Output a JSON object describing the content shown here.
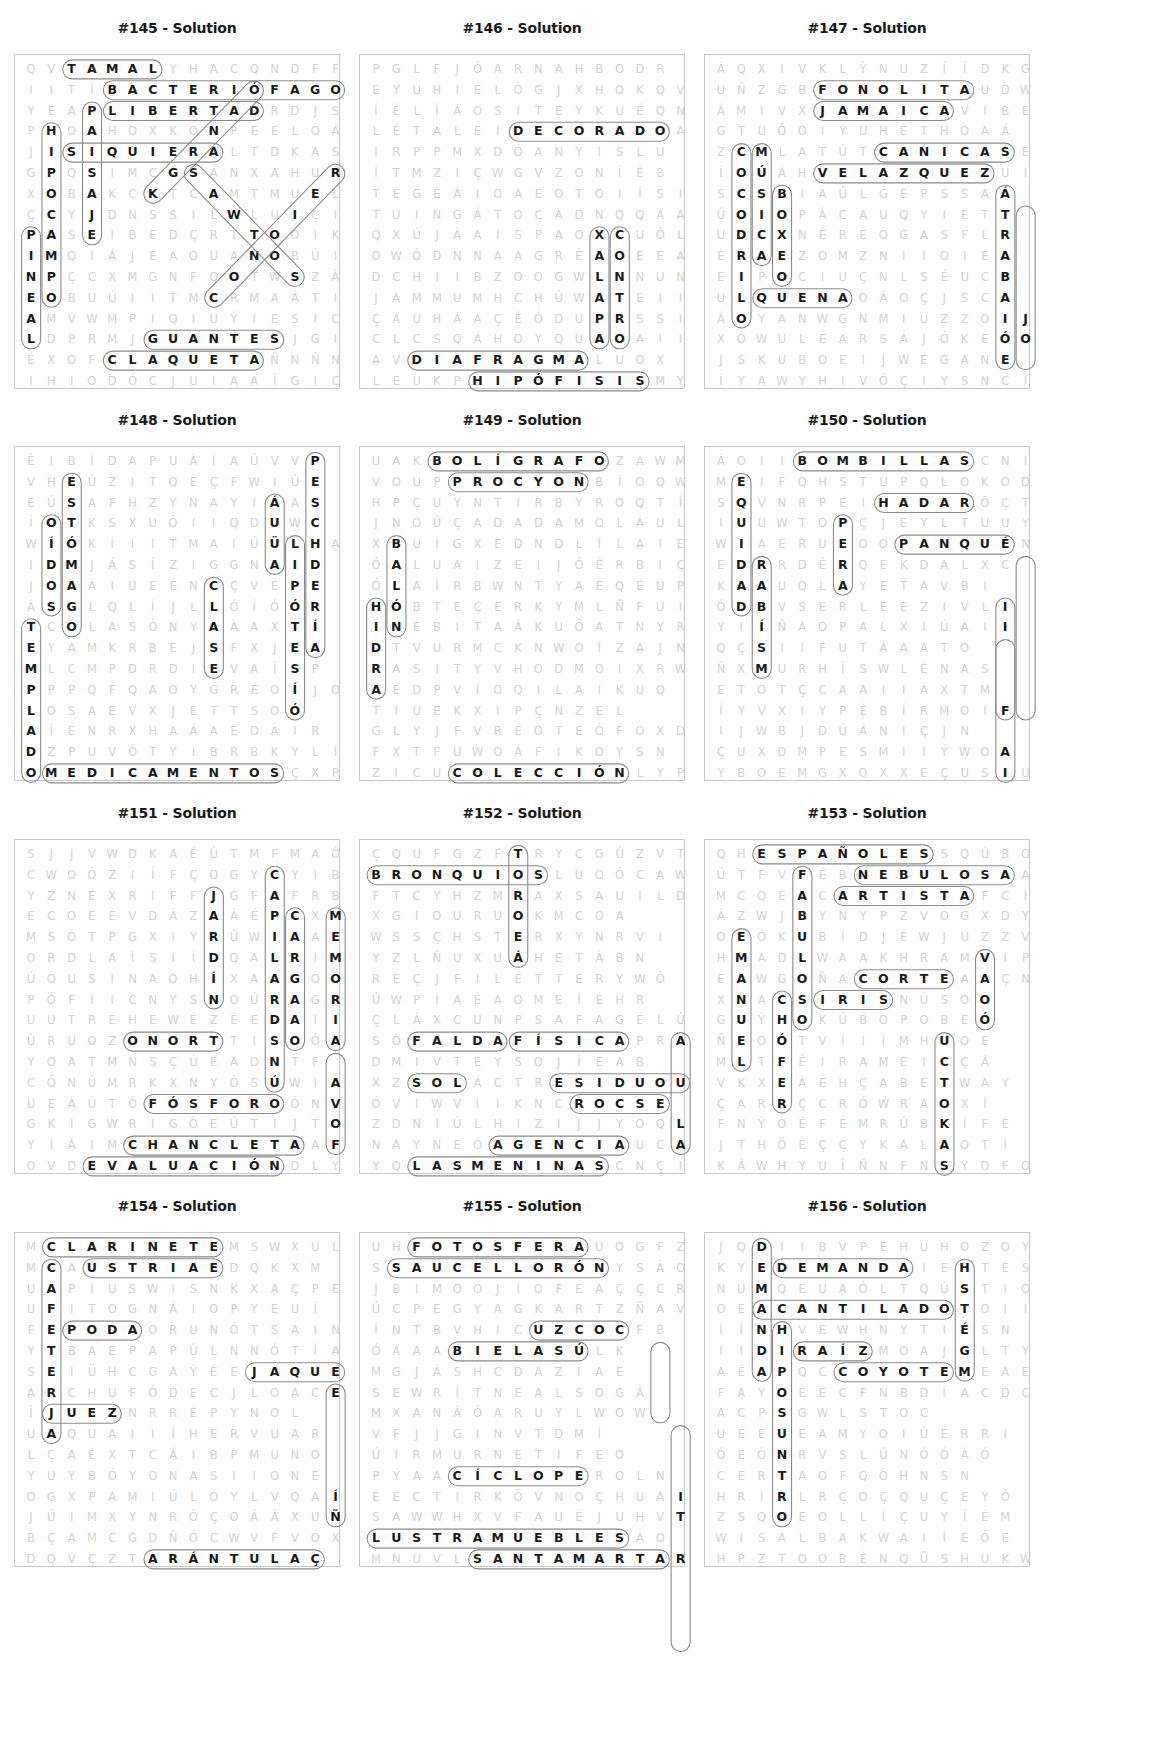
{
  "layout": {
    "cols": 16,
    "rows": 16
  },
  "puzzles": [
    {
      "title": "#145 - Solution",
      "grid": [
        "QVTAMALYHACQNDFF",
        "IITÍBACTERIÓFAGO",
        "YEAPLIBERTADRDJS",
        "PHOAHOXKONPEELOÁ",
        "JISIQUIERALTDKAS",
        "GPQSIMÇGSANXAHUR",
        "XOBAKCKTCAMTMUEL",
        "ÇCYJDNSSILWLUICI",
        "PASEIBEDÇRTTOOIK",
        "IMQIÁJEAOUANOBÚI",
        "NPÇCXMGNFQOTWSZÁ",
        "EOBUÚIITMCRMAÁTI",
        "AMVWMPIQIUÝIESIC",
        "LDPRMJGUANTESJGI",
        "ÉXOFCLAQUETAÑNÑN",
        "IHIODÓCJUIAAÍGIÇ"
      ],
      "words": [
        {
          "w": "TAMAL",
          "r": 0,
          "c": 2,
          "d": "E"
        },
        {
          "w": "BACTERIÓFAGO",
          "r": 1,
          "c": 4,
          "d": "E"
        },
        {
          "w": "LIBERTAD",
          "r": 2,
          "c": 4,
          "d": "E"
        },
        {
          "w": "PAISAJE",
          "r": 2,
          "c": 3,
          "d": "S"
        },
        {
          "w": "HIPOCAMPO",
          "r": 3,
          "c": 1,
          "d": "S"
        },
        {
          "w": "SIQUIERA",
          "r": 4,
          "c": 2,
          "d": "E"
        },
        {
          "w": "PINEAL",
          "r": 8,
          "c": 0,
          "d": "S"
        },
        {
          "w": "GUANTES",
          "r": 13,
          "c": 6,
          "d": "E"
        },
        {
          "w": "CLAQUETA",
          "r": 14,
          "c": 4,
          "d": "E"
        },
        {
          "w": "SANTOS",
          "r": 5,
          "c": 8,
          "d": "SE"
        },
        {
          "w": "RECETAS",
          "r": 5,
          "c": 15,
          "d": "SW"
        },
        {
          "w": "ÓRGANO",
          "r": 1,
          "c": 11,
          "d": "SW"
        }
      ]
    },
    {
      "title": "#146 - Solution",
      "grid": [
        "PGLFJÓARNAHBODR",
        "EYUHIÉLÓGJXHOKQV",
        "ÍÉLÍAOSITEYKUÉQN",
        "LÉTÁLEIDECORADOA",
        "IRPPMXDÓANYISLU",
        "ÍTMZIÇWGVZONÍÉB",
        "TEGÉÁIOAEOTOIÍSI",
        "TUINGÁTOCADNQQAA",
        "QXÚJÀAISPAOXCUÕL",
        "OWÓDNNAAGRÉAOEEA",
        "DCHIIBZOOGWLNNUN",
        "JAMMUMHCHÚWATEII",
        "ÇAUHAAÇÉÓDUPRSSI",
        "CLCSQÁHOYQUAOAII",
        "AVDIAFRAGMALUOX",
        "LEUKPHIPÓFISISMY"
      ],
      "words": [
        {
          "w": "DECORADO",
          "r": 3,
          "c": 7,
          "d": "E"
        },
        {
          "w": "DIAFRAGMA",
          "r": 14,
          "c": 2,
          "d": "E"
        },
        {
          "w": "HIPÓFISIS",
          "r": 15,
          "c": 5,
          "d": "E"
        },
        {
          "w": "XALAPA",
          "r": 8,
          "c": 11,
          "d": "S"
        },
        {
          "w": "CONTRO",
          "r": 8,
          "c": 12,
          "d": "S"
        }
      ]
    },
    {
      "title": "#147 - Solution",
      "grid": [
        "ÁQXIVKLÝNUZÍÍDKG",
        "UÑZGBFONOLITAUDW",
        "ÁMIVXJAMAICAVIBE",
        "GTUÕOIÝUHÉTHOAÁ",
        "ZCMLATÚTCANICASE",
        "ÍOÚÁHVELAZQUEZUI",
        "SCSBIAÚLGEPSSAÁ",
        "ÚOIOPÁCAUQYIETT",
        "UDCXNÉRÉOGASFLR",
        "ÉRAEZOMZNIIOIEA",
        "EIPOCIUÇNLSÉUCB",
        "ULQUENAOÁOÇJSCA",
        "ÁOYANWGNMIUZZOIJ",
        "XÓWULEARSÁJÓKEÓO",
        "JSKUBOEIJWÉGANE",
        "ÍYAWYHIVÓÇIYSNCI"
      ],
      "words": [
        {
          "w": "FONOLITA",
          "r": 1,
          "c": 5,
          "d": "E"
        },
        {
          "w": "JAMAICA",
          "r": 2,
          "c": 5,
          "d": "E"
        },
        {
          "w": "CANICAS",
          "r": 4,
          "c": 8,
          "d": "E"
        },
        {
          "w": "VELAZQUEZ",
          "r": 5,
          "c": 5,
          "d": "E"
        },
        {
          "w": "COCODRILO",
          "r": 4,
          "c": 1,
          "d": "S"
        },
        {
          "w": "MÚSICA",
          "r": 4,
          "c": 2,
          "d": "S"
        },
        {
          "w": "BOXEO",
          "r": 6,
          "c": 3,
          "d": "S"
        },
        {
          "w": "QUENA",
          "r": 11,
          "c": 2,
          "d": "E"
        },
        {
          "w": "ELECTRICA",
          "r": 6,
          "c": 14,
          "d": "S"
        },
        {
          "w": "TREBEJOS",
          "r": 7,
          "c": 15,
          "d": "S"
        }
      ]
    },
    {
      "title": "#148 - Solution",
      "grid": [
        "ÉIBÍDAPUÁÍAÚVVP",
        "VHEÚZITQÉÇFWIÚE",
        "EÚSAFHZYNAYIÁAS",
        "ÍOTKSXUÓIIQDUWC",
        "WÍÓKÍIITMAIÚÜLHA",
        "IDMJÁSÍZIGGNAID",
        "JOAÁIUEÉNCÇVÉPE",
        "ÁSGLQLÍJLLÓÍÓÓR",
        "TCOLASÓNYAÀAXTÍ",
        "EYAMKRBEJSFXJEA",
        "MLCMPDRDIEVAÍSP",
        "PPPQFQAOYGRÉOÍJO",
        "LOSAEVXJETTSOÓ",
        "AÍENRXHAÁAÉOÁIR",
        "DZPUVÓTYIBRBKYLÍ",
        "OMEDICAMENTOSÇXP"
      ],
      "words": [
        {
          "w": "ESTÓMAGO",
          "r": 1,
          "c": 2,
          "d": "S"
        },
        {
          "w": "OÍDOS",
          "r": 3,
          "c": 1,
          "d": "S"
        },
        {
          "w": "AULA",
          "r": 2,
          "c": 12,
          "d": "S"
        },
        {
          "w": "HIPÓTESIS",
          "r": 4,
          "c": 13,
          "d": "S"
        },
        {
          "w": "PESCADERÍA",
          "r": 0,
          "c": 14,
          "d": "S"
        },
        {
          "w": "CLASE",
          "r": 6,
          "c": 9,
          "d": "S"
        },
        {
          "w": "TEMPLADO",
          "r": 8,
          "c": 0,
          "d": "S"
        },
        {
          "w": "MEDICAMENTOS",
          "r": 15,
          "c": 1,
          "d": "E"
        }
      ]
    },
    {
      "title": "#149 - Solution",
      "grid": [
        "UAKBOLÍGRAFOZAWM",
        "VOUPPROCYONBÍOQW",
        "HPÇUYNTIRBYROQTÍ",
        "JNOÚÇADADAMOLÁULI",
        "XBUÍGXEDNDLÍLAIE",
        "ÓALUAIZEIJÓÉRBIÇ",
        "ÓLAÍRBWNTYAEQÉUP",
        "HÓBTEÇERKYMLÑFUI",
        "INEBITAÁKUÕATNYR",
        "DTVURMCKNWOÍZAJN",
        "RASITYVHODMOIXRW",
        "AÉDPVÍOQILAIKUQ",
        "TIUEKXIPÇNZEL",
        "GLYJFVREOTEÓFOXD",
        "FXTFUWOÁFIKOYSN",
        "ZICUCOLECCIÓNLYP"
      ],
      "words": [
        {
          "w": "BOLÍGRAFO",
          "r": 0,
          "c": 3,
          "d": "E"
        },
        {
          "w": "PROCYON",
          "r": 1,
          "c": 4,
          "d": "E"
        },
        {
          "w": "BALÓN",
          "r": 4,
          "c": 1,
          "d": "S"
        },
        {
          "w": "HIDRA",
          "r": 7,
          "c": 0,
          "d": "S"
        },
        {
          "w": "COLECCIÓN",
          "r": 15,
          "c": 4,
          "d": "E"
        }
      ]
    },
    {
      "title": "#150 - Solution",
      "grid": [
        "ÁOIIBOMBILLASCNI",
        "MEIFQHSTUPQLOKOD",
        "SQVNRPEIHADARŌÇT",
        "ÍUUWTOPÇJEYLTUUY",
        "WIAERUEOOPANQUÉN",
        "EDRRDÉRQEKDALXC",
        "KAAUQLAYETAVBI",
        "ÓDBVSERLEEZIVLI",
        "YIÍÑAOPALXIÚÁII",
        "QÇSIIFUTÁAATO",
        "ÑXMURHÍSWLÉNAS",
        "ETOTÇCAAIIÁXTM",
        "ÍYVXIYPÉBÍRMOIF",
        "ÍJWBJDÚÁNIÇJN",
        "ÇUXDMPESMIIÝWOA",
        "YBOEMGXOXXEÇUSIU"
      ],
      "words": [
        {
          "w": "BOMBILLAS",
          "r": 0,
          "c": 4,
          "d": "E"
        },
        {
          "w": "HADAR",
          "r": 2,
          "c": 8,
          "d": "E"
        },
        {
          "w": "PANQUÉ",
          "r": 4,
          "c": 9,
          "d": "E"
        },
        {
          "w": "EQUIDAD",
          "r": 1,
          "c": 1,
          "d": "S"
        },
        {
          "w": "PERA",
          "r": 3,
          "c": 6,
          "d": "S"
        },
        {
          "w": "ABISMO",
          "r": 5,
          "c": 2,
          "d": "S"
        },
        {
          "w": "VIOLÍN",
          "r": 7,
          "c": 14,
          "d": "S"
        },
        {
          "w": "CILINDRO",
          "r": 5,
          "c": 15,
          "d": "S"
        },
        {
          "w": "TOMATES",
          "r": 9,
          "c": 14,
          "d": "S"
        }
      ]
    },
    {
      "title": "#151 - Solution",
      "grid": [
        "SJJVWDKAÉÚTMFMAÓ",
        "CWOÓZIÍFÇOGYCYIB",
        "YZNÉXRIFFJGFAFRB",
        "ÉCOEÉVDÁZAÁÉPCXM",
        "MSÓTPGXIYRÚWIAÁE",
        "ORDLAÍSIÍDQALRIM",
        "ÚOUSINAOHÍXAAGOO",
        "PÓFÍICNYSNOÚRAGR",
        "UUTREHEWÉZÉEDAII",
        "ÚRUOZONORTTISOÓA",
        "YOATMNSÇÚEAONTF",
        "CÓNÚMRKXNYÓSÚWIA",
        "UEÁÚTÓFÓSFOROÓNV",
        "GKIGWRIGÓEÚTIJTO",
        "YÍÁIMCHANCLETAAF",
        "OVDEVALUACIÓNDLY"
      ],
      "words": [
        {
          "w": "JARDÍN",
          "r": 2,
          "c": 9,
          "d": "S"
        },
        {
          "w": "CAPICALARAS",
          "r": 1,
          "c": 12,
          "d": "S"
        },
        {
          "w": "CARGADO",
          "r": 3,
          "c": 13,
          "d": "S"
        },
        {
          "w": "MEMORIA",
          "r": 3,
          "c": 15,
          "d": "S"
        },
        {
          "w": "OZONO",
          "r": 9,
          "c": 5,
          "d": "E"
        },
        {
          "w": "FÓSFORO",
          "r": 12,
          "c": 6,
          "d": "E"
        },
        {
          "w": "CHANCLETA",
          "r": 14,
          "c": 5,
          "d": "E"
        },
        {
          "w": "EVALUACIÓN",
          "r": 15,
          "c": 3,
          "d": "E"
        },
        {
          "w": "FINTA",
          "r": 10,
          "c": 15,
          "d": "S"
        }
      ]
    },
    {
      "title": "#152 - Solution",
      "grid": [
        "ÇQUFGZFTRYCGÚZVT",
        "BRONQUIOSLUOÓCAW",
        "FTCYHZMRAXSAUILD",
        "XGIOURUOKMCOA",
        "WSSÇHSTERXYNRVI",
        "YZLÑUXUÁHETÁBN",
        "REÇJFILETTERYWÓ",
        "ÚWPÍAÉAOMEÍÉHR",
        "ÇLÁXCUNPSAFAGÉLÚ",
        "SÓFALDAFÍSICAPRA",
        "DMIVTEYSOJÍEAB",
        "XZSOLÁCTRESIDUOU",
        "ÓVIWVIIKNCROCSE",
        "ZDNIÚLHIZIJJYOQL",
        "NAYNEÓAGENCIAUCA",
        "YQLASMENINASCNÇI"
      ],
      "words": [
        {
          "w": "BRONQUIOS",
          "r": 1,
          "c": 0,
          "d": "E"
        },
        {
          "w": "TRUENO",
          "r": 0,
          "c": 7,
          "d": "S"
        },
        {
          "w": "FALDA",
          "r": 9,
          "c": 2,
          "d": "E"
        },
        {
          "w": "FÍSICA",
          "r": 9,
          "c": 7,
          "d": "E"
        },
        {
          "w": "SOL",
          "r": 11,
          "c": 2,
          "d": "E"
        },
        {
          "w": "RESIDUO",
          "r": 11,
          "c": 9,
          "d": "E"
        },
        {
          "w": "CROCS",
          "r": 12,
          "c": 10,
          "d": "E"
        },
        {
          "w": "AGENCIA",
          "r": 14,
          "c": 6,
          "d": "E"
        },
        {
          "w": "LASMENINAS",
          "r": 15,
          "c": 2,
          "d": "E"
        },
        {
          "w": "ABUELA",
          "r": 9,
          "c": 15,
          "d": "S"
        }
      ]
    },
    {
      "title": "#153 - Solution",
      "grid": [
        "QHESPAÑOLESSQÚBO",
        "ÜTFVFÉBNEBULOSAA",
        "MCQEACARTISTAFCI",
        "ÁZWJBYNYPZVOGXDY",
        "OEÓKUBÍDJÉWJUZZV",
        "HMADLWAAKHRAMVIP",
        "EAWGOÑACORTEAAÇN",
        "XNACSIRISNÚSOO",
        "GUÝHOKÚBOPOBEÓ",
        "ÑEOÓTVÍIÍMHUOE",
        "MLTFÉIRAMEICÇÁ",
        "VKXEÁEHÇABETWAY",
        "ÇARRÇCRÓWRAOXÍ",
        "FNÝOÉFÉMRÚBKÍFÉ",
        "JTHÕÉÇÇYKALAOTÍ",
        "KÁWHYUÍÑNFNSYDFO"
      ],
      "words": [
        {
          "w": "ESPAÑOLES",
          "r": 0,
          "c": 2,
          "d": "E"
        },
        {
          "w": "NEBULOSA",
          "r": 1,
          "c": 7,
          "d": "E"
        },
        {
          "w": "ARTISTA",
          "r": 2,
          "c": 6,
          "d": "E"
        },
        {
          "w": "FABULOSO",
          "r": 1,
          "c": 4,
          "d": "S"
        },
        {
          "w": "EMANUEL",
          "r": 4,
          "c": 1,
          "d": "S"
        },
        {
          "w": "CORTE",
          "r": 6,
          "c": 7,
          "d": "E"
        },
        {
          "w": "IRIS",
          "r": 7,
          "c": 5,
          "d": "E"
        },
        {
          "w": "CHÓFER",
          "r": 7,
          "c": 3,
          "d": "S"
        },
        {
          "w": "HIERBAS",
          "r": 9,
          "c": 11,
          "d": "S"
        },
        {
          "w": "VASO",
          "r": 5,
          "c": 13,
          "d": "S"
        }
      ]
    },
    {
      "title": "#154 - Solution",
      "grid": [
        "MCLARINETEMSWXUL",
        "MCAUSTRIAEDQKXM",
        "UAPÍUSWISNKXAÇPE",
        "UFITOGNÁIOPYEUÍ",
        "FEPODAORUNÓTSAIN",
        "YTBAEPAPÚLNNÓTÍA",
        "SEIÜHCGAÝÉEJAQUE",
        "ÁRCHUFÓDÉCJLOACE",
        "ÍJUEZNRRÉPYNOL",
        "UAQUAIIÍHERVUAR",
        "LCAÉXTCÁIBPMUNO",
        "YUYBÓYONASIIONE",
        "OGXPAMIÚLOYLVQAÍ",
        "JÚIMXYNRÓÇOÁÁXUÑ",
        "BÇAMCGDÑÓCWVFVÓX",
        "DQVÇZTARÁNTULAÇ"
      ],
      "words": [
        {
          "w": "CLARINETE",
          "r": 0,
          "c": 1,
          "d": "E"
        },
        {
          "w": "AUSTRIA",
          "r": 1,
          "c": 3,
          "d": "E"
        },
        {
          "w": "CAFETERÍA",
          "r": 1,
          "c": 1,
          "d": "S"
        },
        {
          "w": "PODA",
          "r": 4,
          "c": 2,
          "d": "E"
        },
        {
          "w": "JAQUE",
          "r": 6,
          "c": 11,
          "d": "E"
        },
        {
          "w": "JUEZ",
          "r": 8,
          "c": 1,
          "d": "E"
        },
        {
          "w": "TARÁNTULA",
          "r": 15,
          "c": 6,
          "d": "E"
        },
        {
          "w": "CORONEA",
          "r": 7,
          "c": 15,
          "d": "S"
        }
      ]
    },
    {
      "title": "#155 - Solution",
      "grid": [
        "UHFOTOSFERAUOGFZ",
        "SSAUCELLORÓNYSÁO",
        "JBIMOOJÍOFEAÇÇCR",
        "ÚCPEGYAGKARTZÑAV",
        "ÍNTBVHICUZCOCFB",
        "ÓAAABIELASÚLK",
        "MGJÁSHCDAZIAE",
        "SEWRÍTNEALSOGÁ",
        "MXANÁÓARUYLWOW",
        "VFJJGINVTDMÍ",
        "ÚIRMURNETIFEO",
        "PÝAACÍCLOPEROLN",
        "ÉÉCTIRKÖVNOÇHUAI",
        "SAWWHXVFAUÉJUHVT",
        "LUSTRAMUEBLESAO",
        "MNUVLSANTAMARTAR"
      ],
      "words": [
        {
          "w": "FOTOSFERA",
          "r": 0,
          "c": 2,
          "d": "E"
        },
        {
          "w": "SAUCELLORÓN",
          "r": 1,
          "c": 1,
          "d": "E"
        },
        {
          "w": "CUZCO",
          "r": 4,
          "c": 8,
          "d": "E"
        },
        {
          "w": "ABIELAS",
          "r": 5,
          "c": 4,
          "d": "E"
        },
        {
          "w": "CÍCLOPE",
          "r": 11,
          "c": 4,
          "d": "E"
        },
        {
          "w": "LUSTRAMUEBLES",
          "r": 14,
          "c": 0,
          "d": "E"
        },
        {
          "w": "SANTAMARTA",
          "r": 15,
          "c": 5,
          "d": "E"
        },
        {
          "w": "LAGO",
          "r": 5,
          "c": 14,
          "d": "S"
        },
        {
          "w": "DEONTOLOGÍA",
          "r": 9,
          "c": 15,
          "d": "S"
        }
      ]
    },
    {
      "title": "#156 - Solution",
      "grid": [
        "JQDIIBVPEHUHOZOY",
        "KYEDEMANDAIEHTÉS",
        "NUMQEUAÓLTQÚSTIO",
        "OEACANTILADOTOII",
        "ÍÍNHVEWHNYTIÉSN",
        "IIDIRAÍZMOAJGLTY",
        "AÉAPQCCOYOTEMEAE",
        "FAYOÉÉCFNBDÍACDC",
        "ACPSGWLSTOC",
        "UÉEUEAMYOIÚERRI",
        "ÓEÓNRVSLÚNÓÓÁÓ",
        "CERTAOFQÓHNSN",
        "HRÍRLRÇOÇQUÇEYÓ",
        "ZSQOEOLLÍÇUYÍÉM",
        "WISALBAKWAIÍEÓE",
        "HPZTOOBÉNQÜSHUKW"
      ],
      "words": [
        {
          "w": "DEMANDA",
          "r": 0,
          "c": 2,
          "d": "S"
        },
        {
          "w": "DEMANDA",
          "r": 1,
          "c": 3,
          "d": "E"
        },
        {
          "w": "ACANTILADO",
          "r": 3,
          "c": 2,
          "d": "E"
        },
        {
          "w": "RAÍZ",
          "r": 5,
          "c": 4,
          "d": "E"
        },
        {
          "w": "COYOTE",
          "r": 6,
          "c": 6,
          "d": "E"
        },
        {
          "w": "HIPOPÓTAMO",
          "r": 4,
          "c": 3,
          "d": "S"
        },
        {
          "w": "ESTILO",
          "r": 1,
          "c": 12,
          "d": "S"
        }
      ]
    }
  ]
}
